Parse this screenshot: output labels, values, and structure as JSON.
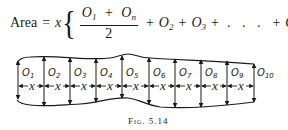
{
  "formula": {
    "lhs": "Area",
    "equals": "=",
    "factor": "x",
    "open_brace": "{",
    "close_brace": "}",
    "numerator": {
      "a": "O",
      "a_sub": "1",
      "plus": "+",
      "b": "O",
      "b_sub": "n"
    },
    "denominator": "2",
    "terms": [
      {
        "op": "+",
        "sym": "O",
        "sub": "2"
      },
      {
        "op": "+",
        "sym": "O",
        "sub": "3"
      },
      {
        "op": "+",
        "sym": ". . .",
        "sub": ""
      },
      {
        "op": "+",
        "sym": "O",
        "sub": "n−1"
      }
    ]
  },
  "figure": {
    "ordinate_labels": [
      "O1",
      "O2",
      "O3",
      "O4",
      "O5",
      "O6",
      "O7",
      "O8",
      "O9",
      "O10"
    ],
    "interval_label": "x",
    "interval_count": 9,
    "caption": "Fig. 5.14"
  }
}
